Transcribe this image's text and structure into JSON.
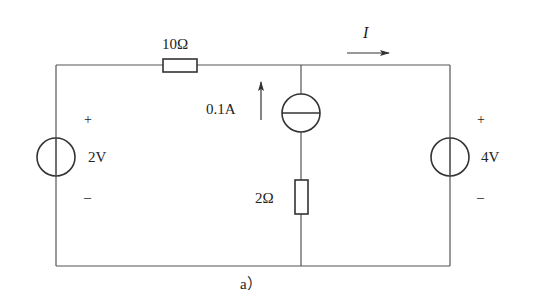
{
  "diagram": {
    "type": "electrical-circuit",
    "caption": "a）",
    "components": {
      "resistor_top": {
        "label": "10Ω"
      },
      "current_source": {
        "label": "0.1A",
        "direction": "up"
      },
      "resistor_mid": {
        "label": "2Ω"
      },
      "voltage_source_left": {
        "label": "2V",
        "plus": "+",
        "minus": "–"
      },
      "voltage_source_right": {
        "label": "4V",
        "plus": "+",
        "minus": "–"
      }
    },
    "current_label": {
      "label": "I",
      "direction": "right"
    },
    "colors": {
      "wire": "#555555",
      "component": "#333333",
      "text": "#222222",
      "background": "#ffffff"
    }
  }
}
